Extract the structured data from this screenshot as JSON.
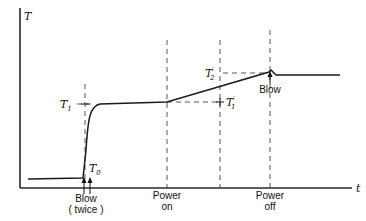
{
  "diagram": {
    "type": "temperature-vs-time sketch",
    "axes": {
      "y_label": "T",
      "x_label": "t"
    },
    "levels": {
      "T0": {
        "symbol": "T",
        "subscript": "0"
      },
      "T1": {
        "symbol": "T",
        "subscript": "1"
      },
      "T1_prime": {
        "symbol": "T",
        "prime": "′",
        "subscript": "1"
      },
      "T2_prime": {
        "symbol": "T",
        "prime": "′",
        "subscript": "2"
      }
    },
    "events": [
      {
        "id": "blow-twice",
        "line1": "Blow",
        "line2": "( twice )"
      },
      {
        "id": "power-on",
        "line1": "Power",
        "line2": "on"
      },
      {
        "id": "power-off",
        "line1": "Power",
        "line2": "off"
      },
      {
        "id": "blow-top",
        "line1": "Blow"
      }
    ]
  }
}
